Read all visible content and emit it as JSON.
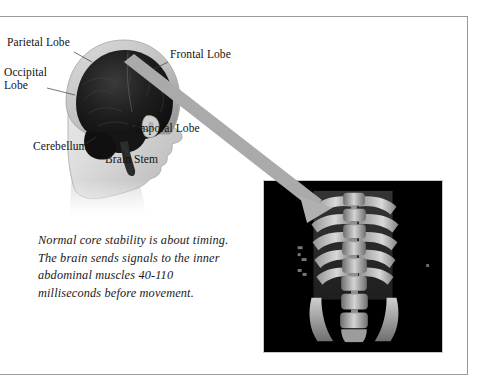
{
  "figure": {
    "background_color": "#ffffff",
    "frame_color": "#9a9a9a",
    "arrow_color": "#aaaaaa"
  },
  "head_diagram": {
    "name": "lateral head and brain illustration",
    "labels": [
      {
        "id": "parietal",
        "text": "Parietal Lobe"
      },
      {
        "id": "occipital",
        "text": "Occipital\nLobe"
      },
      {
        "id": "frontal",
        "text": "Frontal Lobe"
      },
      {
        "id": "temporal",
        "text": "Temporal Lobe"
      },
      {
        "id": "cerebellum",
        "text": "Cerebellum"
      },
      {
        "id": "brainstem",
        "text": "Brain Stem"
      }
    ]
  },
  "caption": {
    "text": "Normal core stability is about timing. The brain sends signals to the inner abdominal muscles 40-110 milliseconds before movement."
  },
  "scan_image": {
    "name": "spine and rib cage radiograph",
    "background_color": "#000000"
  }
}
